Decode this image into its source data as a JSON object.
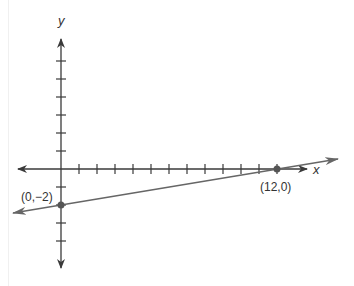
{
  "chart_data": {
    "type": "line",
    "title": "",
    "xlabel": "x",
    "ylabel": "y",
    "grid": false,
    "legend": null,
    "x_ticks": [
      1,
      2,
      3,
      4,
      5,
      6,
      7,
      8,
      9,
      10,
      11,
      12
    ],
    "y_ticks": [
      -4,
      -3,
      -2,
      -1,
      1,
      2,
      3,
      4,
      5,
      6
    ],
    "xlim": [
      -2.7,
      13.3
    ],
    "ylim": [
      -5.4,
      7.2
    ],
    "series": [
      {
        "name": "line",
        "points": [
          [
            0,
            -2
          ],
          [
            12,
            0
          ]
        ],
        "slope": 0.1667,
        "intercept": -2,
        "extends_both_directions": true
      }
    ],
    "annotations": [
      {
        "label": "(0,−2)",
        "x": 0,
        "y": -2
      },
      {
        "label": "(12,0)",
        "x": 12,
        "y": 0
      }
    ]
  },
  "labels": {
    "x_axis": "x",
    "y_axis": "y",
    "point_a": "(0,−2)",
    "point_b": "(12,0)"
  },
  "colors": {
    "axis": "#3a3a3a",
    "line": "#666666",
    "point": "#555555"
  },
  "geometry": {
    "origin_px": [
      61,
      169
    ],
    "unit_px": 18
  }
}
